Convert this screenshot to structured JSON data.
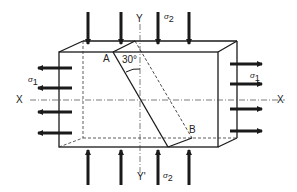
{
  "diagram": {
    "type": "stress-block",
    "colors": {
      "line": "#1a1a1a",
      "background": "#ffffff"
    },
    "labels": {
      "axis_y_top": "Y",
      "axis_y_bottom": "Y'",
      "axis_x_left": "X",
      "axis_x_right": "X",
      "point_a": "A",
      "point_b": "B",
      "angle": "30°",
      "sigma_symbol": "σ",
      "sigma_1_sub": "1",
      "sigma_2_sub": "2"
    },
    "forces": {
      "sigma_1": {
        "direction": "horizontal-tension",
        "arrows_per_side": 4
      },
      "sigma_2": {
        "direction": "vertical-compression",
        "arrows_per_side": 4
      }
    }
  }
}
